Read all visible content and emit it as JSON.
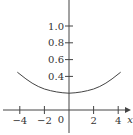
{
  "chart_data": {
    "type": "line",
    "title": "",
    "xlabel": "x",
    "ylabel": "",
    "xlim": [
      -4.2,
      4.3
    ],
    "ylim": [
      -0.2,
      1.3
    ],
    "x_ticks": [
      -4,
      -2,
      2,
      4
    ],
    "x_tick_labels": [
      "−4",
      "−2",
      "2",
      "4"
    ],
    "y_ticks": [
      0.4,
      0.6,
      0.8,
      1.0
    ],
    "y_tick_labels": [
      "0.4",
      "0.6",
      "0.8",
      "1.0"
    ],
    "origin_label": "0",
    "grid": false,
    "legend": null,
    "series": [
      {
        "name": "curve",
        "x": [
          -4.2,
          -3.5,
          -3,
          -2.5,
          -2,
          -1.5,
          -1,
          -0.5,
          0,
          0.5,
          1,
          1.5,
          2,
          2.5,
          3,
          3.5,
          4.2
        ],
        "y": [
          0.45,
          0.37,
          0.32,
          0.28,
          0.25,
          0.23,
          0.215,
          0.205,
          0.2,
          0.205,
          0.215,
          0.23,
          0.25,
          0.28,
          0.32,
          0.37,
          0.45
        ]
      }
    ],
    "colors": {
      "axis": "#444444",
      "curve": "#444444",
      "text": "#333333"
    }
  }
}
